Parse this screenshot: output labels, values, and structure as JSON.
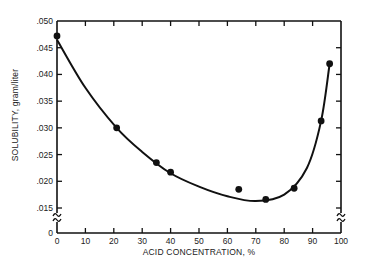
{
  "chart_data": {
    "type": "scatter",
    "title": "",
    "xlabel": "ACID CONCENTRATION, %",
    "ylabel": "SOLUBILITY, gram/liter",
    "xlim": [
      0,
      100
    ],
    "ylim": [
      0,
      0.05
    ],
    "y_axis_break": [
      0,
      0.015
    ],
    "grid": false,
    "legend": null,
    "x_ticks": [
      "0",
      "10",
      "20",
      "30",
      "40",
      "50",
      "60",
      "70",
      "80",
      "90",
      "100"
    ],
    "y_ticks": [
      ".050",
      ".045",
      ".040",
      ".035",
      ".030",
      ".025",
      ".020",
      ".015",
      "0"
    ],
    "series": [
      {
        "name": "measured",
        "marker": "filled-circle",
        "x": [
          0,
          21,
          35,
          40,
          64,
          73.5,
          83.5,
          93,
          96
        ],
        "y": [
          0.0472,
          0.03,
          0.0235,
          0.0217,
          0.0185,
          0.0166,
          0.0187,
          0.0313,
          0.042
        ]
      },
      {
        "name": "fitted-curve",
        "line": "smooth",
        "x": [
          0,
          10,
          21,
          30,
          40,
          50,
          60,
          70,
          80,
          88,
          93,
          96
        ],
        "y": [
          0.0465,
          0.0375,
          0.03,
          0.0255,
          0.0215,
          0.019,
          0.0172,
          0.0163,
          0.0175,
          0.0225,
          0.0313,
          0.042
        ]
      }
    ]
  }
}
